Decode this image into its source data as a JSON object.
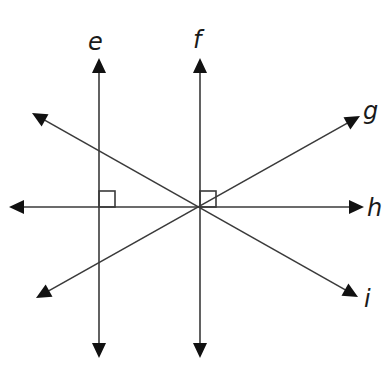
{
  "diagram": {
    "title": "",
    "intersection_point": {
      "x": 200,
      "y": 207
    },
    "lines": [
      {
        "id": "e",
        "label": "e",
        "orientation": "vertical",
        "x1": 99,
        "y1": 58,
        "x2": 99,
        "y2": 358,
        "label_x": 88,
        "label_y": 50
      },
      {
        "id": "f",
        "label": "f",
        "orientation": "vertical",
        "x1": 200,
        "y1": 58,
        "x2": 200,
        "y2": 358,
        "label_x": 193,
        "label_y": 48
      },
      {
        "id": "g",
        "label": "g",
        "orientation": "diagonal-up",
        "x1": 36,
        "y1": 298,
        "x2": 360,
        "y2": 116,
        "label_x": 363,
        "label_y": 119
      },
      {
        "id": "h",
        "label": "h",
        "orientation": "horizontal",
        "x1": 9,
        "y1": 207,
        "x2": 364,
        "y2": 207,
        "label_x": 367,
        "label_y": 216
      },
      {
        "id": "i",
        "label": "i",
        "orientation": "diagonal-down",
        "x1": 32,
        "y1": 113,
        "x2": 358,
        "y2": 297,
        "label_x": 364,
        "label_y": 307
      }
    ],
    "right_angles": [
      {
        "at": "e-h",
        "x": 99,
        "y": 207,
        "size": 16
      },
      {
        "at": "f-h",
        "x": 200,
        "y": 207,
        "size": 16
      }
    ],
    "relationships": [
      "e ⊥ h",
      "f ⊥ h",
      "e ∥ f"
    ]
  }
}
